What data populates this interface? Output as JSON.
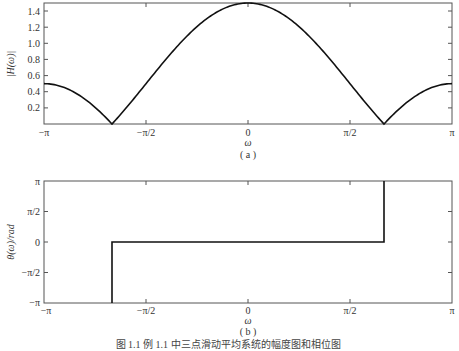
{
  "chart_data": [
    {
      "type": "line",
      "panel": "(a)",
      "title": "",
      "xlabel": "ω",
      "ylabel": "|H(ω)|",
      "xlim": [
        -3.14159,
        3.14159
      ],
      "ylim": [
        0,
        1.5
      ],
      "grid": false,
      "x_ticks": [
        "−π",
        "−π/2",
        "0",
        "π/2",
        "π"
      ],
      "y_ticks": [
        "0.2",
        "0.4",
        "0.6",
        "0.8",
        "1.0",
        "1.2",
        "1.4"
      ],
      "series": [
        {
          "name": "|H(ω)|",
          "x": [
            -3.1416,
            -2.618,
            -2.0944,
            -1.5708,
            -1.0472,
            -0.5236,
            0,
            0.5236,
            1.0472,
            1.5708,
            2.0944,
            2.618,
            3.1416
          ],
          "values": [
            0.5,
            0.366,
            0.0,
            0.5,
            1.0,
            1.366,
            1.5,
            1.366,
            1.0,
            0.5,
            0.0,
            0.366,
            0.5
          ]
        }
      ]
    },
    {
      "type": "line",
      "panel": "(b)",
      "title": "",
      "xlabel": "ω",
      "ylabel": "θ(ω)/rad",
      "xlim": [
        -3.14159,
        3.14159
      ],
      "ylim": [
        -3.14159,
        3.14159
      ],
      "grid": false,
      "x_ticks": [
        "−π",
        "−π/2",
        "0",
        "π/2",
        "π"
      ],
      "y_ticks": [
        "−π",
        "−π/2",
        "0",
        "π/2",
        "π"
      ],
      "series": [
        {
          "name": "θ(ω)",
          "x": [
            -2.0944,
            -2.0944,
            2.0944,
            2.0944
          ],
          "values": [
            -3.1416,
            0,
            0,
            3.1416
          ]
        }
      ]
    }
  ],
  "figure": {
    "panel_a": {
      "ylabel": "|H(ω)|",
      "xlabel": "ω",
      "sublabel": "( a )",
      "x_ticks": [
        "−π",
        "−π/2",
        "0",
        "π/2",
        "π"
      ],
      "y_ticks": [
        "1.4",
        "1.2",
        "1.0",
        "0.8",
        "0.6",
        "0.4",
        "0.2"
      ]
    },
    "panel_b": {
      "ylabel": "θ(ω)/rad",
      "xlabel": "ω",
      "sublabel": "( b )",
      "x_ticks": [
        "−π",
        "−π/2",
        "0",
        "π/2",
        "π"
      ],
      "y_ticks": [
        "π",
        "π/2",
        "0",
        "−π/2",
        "−π"
      ]
    },
    "caption": "图 1.1   例 1.1 中三点滑动平均系统的幅度图和相位图"
  }
}
